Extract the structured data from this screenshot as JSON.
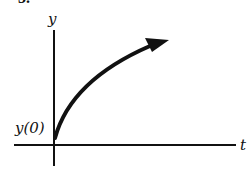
{
  "figure": {
    "number_label": "3.",
    "y_axis_label": "y",
    "x_axis_label": "t",
    "initial_value_label": "y(0)",
    "colors": {
      "ink": "#111111",
      "background": "#ffffff"
    }
  },
  "curve": {
    "description": "increasing concave-down curve starting at y(0) with arrow pointing up-right",
    "shape": "growth-saturating"
  }
}
